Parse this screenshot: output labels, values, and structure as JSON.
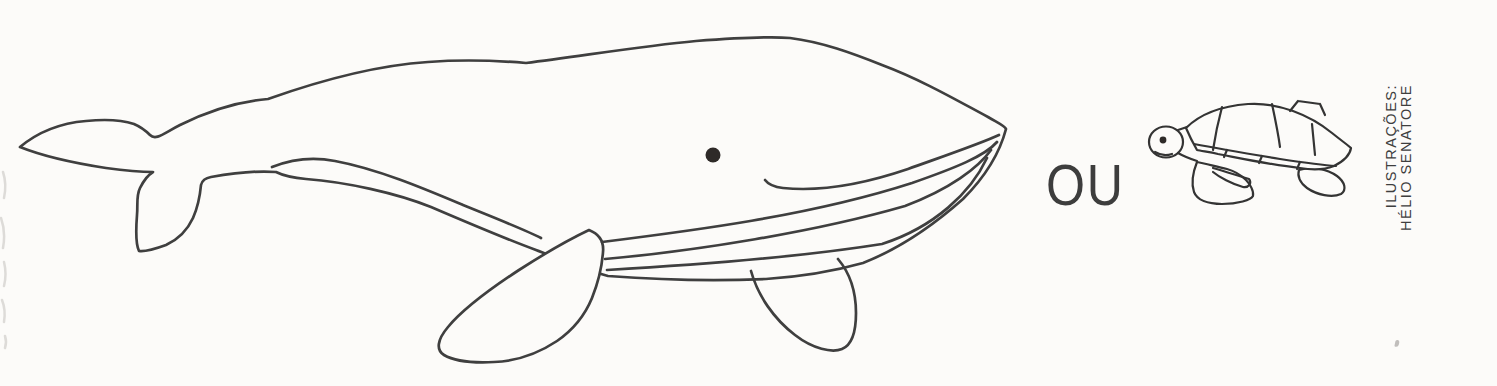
{
  "illustration": {
    "connector_label": "OU",
    "items": [
      {
        "name": "whale-line-drawing",
        "description": "large outline drawing of a whale facing right"
      },
      {
        "name": "sea-turtle-line-drawing",
        "description": "small outline drawing of a sea turtle facing left"
      }
    ],
    "credit": {
      "line1": "ILUSTRAÇÕES:",
      "line2": "HÉLIO SENATORE"
    }
  },
  "palette": {
    "paper": "#fcfbf9",
    "line": "#3f3f3f",
    "turtle_line": "#343434",
    "text": "#3d3d3d",
    "eye_ink": "#2e2a28"
  }
}
